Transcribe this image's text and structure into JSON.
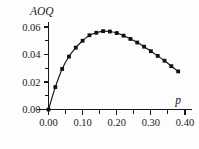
{
  "chart_data": {
    "type": "line",
    "title": "",
    "ylabel": "AOQ",
    "xlabel": "p",
    "xlim": [
      0.0,
      0.4
    ],
    "ylim": [
      0.0,
      0.065
    ],
    "grid": false,
    "legend": null,
    "marker_style": "filled-square",
    "x_ticks_major": [
      "0.00",
      "0.10",
      "0.20",
      "0.30",
      "0.40"
    ],
    "x_tick_values": [
      0.0,
      0.1,
      0.2,
      0.3,
      0.4
    ],
    "x_ticks_minor_values": [
      0.05,
      0.15,
      0.25,
      0.35
    ],
    "y_ticks_major": [
      "0.00",
      "0.02",
      "0.04",
      "0.06"
    ],
    "y_tick_values": [
      0.0,
      0.02,
      0.04,
      0.06
    ],
    "y_ticks_minor_values": [
      0.01,
      0.03,
      0.05
    ],
    "series": [
      {
        "name": "AOQ",
        "x": [
          0.0,
          0.02,
          0.04,
          0.06,
          0.08,
          0.1,
          0.12,
          0.14,
          0.16,
          0.18,
          0.2,
          0.22,
          0.24,
          0.26,
          0.28,
          0.3,
          0.32,
          0.34,
          0.36,
          0.38
        ],
        "values": [
          0.0,
          0.0163,
          0.0295,
          0.0385,
          0.045,
          0.05,
          0.054,
          0.0558,
          0.057,
          0.0567,
          0.0556,
          0.0537,
          0.0513,
          0.0487,
          0.0457,
          0.0424,
          0.039,
          0.0355,
          0.0315,
          0.0277
        ]
      }
    ],
    "peak": {
      "x": 0.16,
      "y": 0.057
    }
  },
  "labels": {
    "y_axis_title": "AOQ",
    "x_axis_title": "p"
  }
}
